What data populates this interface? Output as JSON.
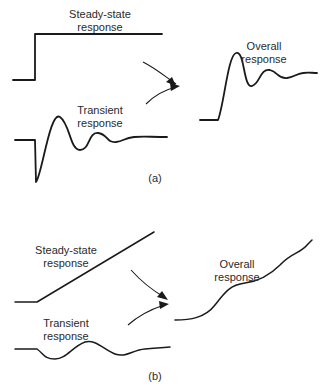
{
  "panel_a": {
    "caption": "(a)",
    "steady_label": [
      "Steady-state",
      "response"
    ],
    "transient_label": [
      "Transient",
      "response"
    ],
    "overall_label": [
      "Overall",
      "response"
    ],
    "steady_path": "M13,80 L35,80 L35,34 L162,34",
    "transient_path": "M15,140 L35,140 L36,182 C42,175 50,110 60,117 C70,124 70,150 80,150 C90,150 88,132 98,133 C108,134 106,143 116,142 C124,141 124,138 134,137 C144,136 150,137 167,137",
    "overall_path": "M200,120 L218,120 C224,105 228,55 236,53 C245,50 243,88 252,86 C260,84 260,68 270,70 C278,72 278,79 287,78 C294,77 296,74 303,73 C308,72 312,73 317,73",
    "arrow1": {
      "path": "M143,62 C155,68 166,77 176,84",
      "head": "176,86 166,82 172,77"
    },
    "arrow2": {
      "path": "M146,104 C154,96 164,90 176,87",
      "head": "180,86 170,83 171,91"
    }
  },
  "panel_b": {
    "caption": "(b)",
    "steady_label": [
      "Steady-state",
      "response"
    ],
    "transient_label": [
      "Transient",
      "response"
    ],
    "overall_label": [
      "Overall",
      "response"
    ],
    "steady_path": "M15,302 L37,302 L154,232",
    "transient_path": "M15,349 L37,349 C44,354 44,359 55,359 C66,359 72,347 85,342 C96,339 104,350 115,354 C126,358 132,350 145,349 C156,348 160,348 170,347",
    "overall_path": "M175,320 C190,320 205,318 215,305 C225,292 230,285 245,283 C260,281 270,275 280,265 C292,252 300,254 308,244 C310,242 311,241 312,240",
    "arrow1": {
      "path": "M131,270 C140,280 152,290 164,297",
      "head": "168,300 157,297 162,291"
    },
    "arrow2": {
      "path": "M128,325 C138,316 152,309 164,305",
      "head": "169,304 159,301 160,309"
    }
  }
}
